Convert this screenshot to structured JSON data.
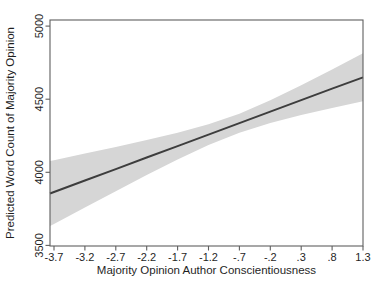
{
  "chart_data": {
    "type": "line",
    "title": "",
    "xlabel": "Majority Opinion Author Conscientiousness",
    "ylabel": "Predicted Word Count of Majority Opinion",
    "x": [
      -3.7,
      -3.2,
      -2.7,
      -2.2,
      -1.7,
      -1.2,
      -0.7,
      -0.2,
      0.3,
      0.8,
      1.3
    ],
    "series": [
      {
        "name": "fitted-line",
        "values": [
          3865,
          3944,
          4022,
          4101,
          4179,
          4258,
          4336,
          4415,
          4493,
          4572,
          4650
        ]
      },
      {
        "name": "ci-lower",
        "values": [
          3647,
          3760,
          3871,
          3981,
          4087,
          4187,
          4271,
          4337,
          4391,
          4440,
          4486
        ]
      },
      {
        "name": "ci-upper",
        "values": [
          4083,
          4128,
          4173,
          4221,
          4271,
          4329,
          4401,
          4493,
          4595,
          4704,
          4814
        ]
      }
    ],
    "x_tick_labels": [
      "-3.7",
      "-3.2",
      "-2.7",
      "-2.2",
      "-1.7",
      "-1.2",
      "-.7",
      "-.2",
      ".3",
      ".8",
      "1.3"
    ],
    "y_ticks": [
      3500,
      4000,
      4500,
      5000
    ],
    "y_tick_labels": [
      "3500",
      "4000",
      "4500",
      "5000"
    ],
    "xlim": [
      -3.7,
      1.3
    ],
    "ylim": [
      3500,
      5000
    ],
    "grid": false,
    "legend": "none",
    "colors": {
      "band": "#d6d6d6",
      "line": "#3d3d3d",
      "frame": "#5f5f5f",
      "text": "#1f1f1f",
      "background": "#ffffff"
    }
  }
}
